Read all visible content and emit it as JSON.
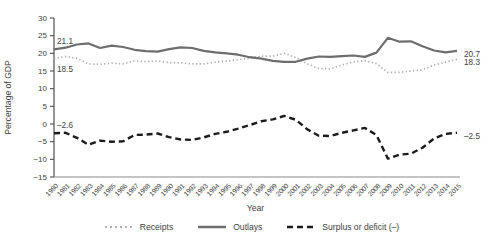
{
  "figure": {
    "ylabel": "Percentage of GDP",
    "xlabel": "Year",
    "legend": [
      {
        "label": "Receipts",
        "style": "dotted",
        "color": "#b0b0b0"
      },
      {
        "label": "Outlays",
        "style": "solid",
        "color": "#6d6d6d"
      },
      {
        "label": "Surplus or deficit (–)",
        "style": "dashed",
        "color": "#1b1b1b"
      }
    ]
  },
  "chart_data": {
    "type": "line",
    "title": "",
    "xlabel": "Year",
    "ylabel": "Percentage of GDP",
    "x": [
      1980,
      1981,
      1982,
      1983,
      1984,
      1985,
      1986,
      1987,
      1988,
      1989,
      1990,
      1991,
      1992,
      1993,
      1994,
      1995,
      1996,
      1997,
      1998,
      1999,
      2000,
      2001,
      2002,
      2003,
      2004,
      2005,
      2006,
      2007,
      2008,
      2009,
      2010,
      2011,
      2012,
      2013,
      2014,
      2015
    ],
    "ylim": [
      -15,
      30
    ],
    "yticks": [
      30,
      25,
      20,
      15,
      10,
      5,
      0,
      -5,
      -10,
      -15
    ],
    "grid": false,
    "legend_position": "bottom",
    "axis_color": "#4f4f4f",
    "text_color": "#3f3f3f",
    "series": [
      {
        "name": "Receipts",
        "line_style": "dotted",
        "color": "#adadad",
        "values": [
          18.5,
          19.1,
          18.6,
          17.0,
          16.9,
          17.2,
          17.0,
          17.9,
          17.6,
          17.8,
          17.4,
          17.3,
          17.0,
          17.0,
          17.5,
          17.8,
          18.2,
          18.6,
          19.2,
          19.2,
          20.0,
          18.8,
          17.0,
          15.7,
          15.6,
          16.7,
          17.6,
          17.9,
          17.1,
          14.6,
          14.6,
          15.0,
          15.3,
          16.7,
          17.5,
          18.3
        ]
      },
      {
        "name": "Outlays",
        "line_style": "solid",
        "color": "#6d6d6d",
        "values": [
          21.1,
          21.6,
          22.5,
          22.8,
          21.5,
          22.2,
          21.8,
          21.0,
          20.6,
          20.5,
          21.2,
          21.7,
          21.5,
          20.7,
          20.3,
          20.0,
          19.6,
          18.9,
          18.5,
          17.9,
          17.6,
          17.6,
          18.5,
          19.1,
          19.0,
          19.2,
          19.4,
          19.0,
          20.2,
          24.4,
          23.3,
          23.4,
          22.0,
          20.8,
          20.3,
          20.7
        ]
      },
      {
        "name": "Surplus or deficit (–)",
        "line_style": "dashed",
        "color": "#1b1b1b",
        "values": [
          -2.6,
          -2.5,
          -3.9,
          -5.9,
          -4.7,
          -5.0,
          -4.9,
          -3.1,
          -3.0,
          -2.7,
          -3.7,
          -4.4,
          -4.5,
          -3.8,
          -2.8,
          -2.2,
          -1.3,
          -0.3,
          0.8,
          1.3,
          2.3,
          1.2,
          -1.5,
          -3.3,
          -3.4,
          -2.5,
          -1.8,
          -1.1,
          -3.1,
          -9.8,
          -8.7,
          -8.4,
          -6.7,
          -4.1,
          -2.8,
          -2.5
        ]
      }
    ],
    "annotations": [
      {
        "text": "21.1",
        "x": 1980,
        "y": 21.1,
        "position": "above-start"
      },
      {
        "text": "18.5",
        "x": 1980,
        "y": 18.5,
        "position": "below-start"
      },
      {
        "text": "–2.6",
        "x": 1980,
        "y": -2.6,
        "position": "above-start"
      },
      {
        "text": "20.7",
        "x": 2015,
        "y": 20.7,
        "position": "end"
      },
      {
        "text": "18.3",
        "x": 2015,
        "y": 18.3,
        "position": "end"
      },
      {
        "text": "–2.5",
        "x": 2015,
        "y": -2.5,
        "position": "end"
      }
    ]
  }
}
